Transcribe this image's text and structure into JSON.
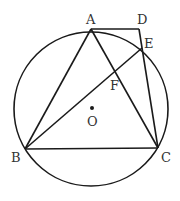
{
  "diagram": {
    "type": "geometry-circle-inscribed-triangle",
    "stroke_color": "#1a1a1a",
    "circle": {
      "center_label": "O",
      "cx": 91,
      "cy": 109,
      "r": 77
    },
    "points": {
      "A": {
        "label": "A",
        "x": 91,
        "y": 29
      },
      "B": {
        "label": "B",
        "x": 25,
        "y": 149
      },
      "C": {
        "label": "C",
        "x": 158,
        "y": 148
      },
      "D": {
        "label": "D",
        "x": 139,
        "y": 29
      },
      "E": {
        "label": "E",
        "x": 142,
        "y": 48
      },
      "F": {
        "label": "F",
        "x": 115,
        "y": 70
      },
      "O": {
        "label": "O",
        "x": 92,
        "y": 108
      }
    },
    "segments": [
      "AB",
      "AC",
      "BC",
      "AD",
      "DC",
      "BE",
      "AE"
    ],
    "labels": {
      "A": "A",
      "B": "B",
      "C": "C",
      "D": "D",
      "E": "E",
      "F": "F",
      "O": "O"
    }
  }
}
